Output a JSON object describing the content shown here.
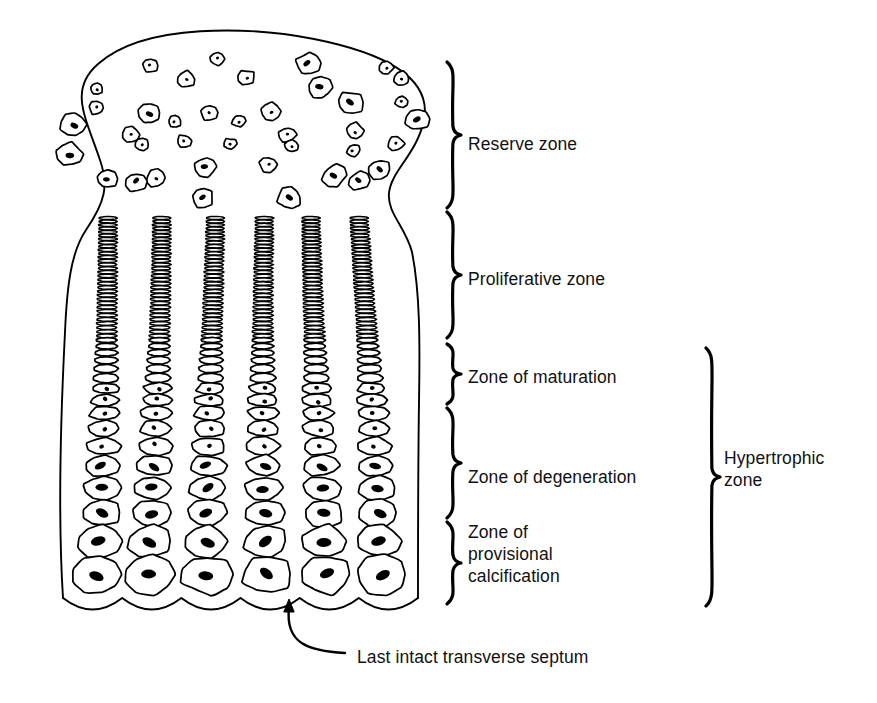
{
  "figure": {
    "background_color": "#ffffff",
    "ink_color": "#000000",
    "width": 877,
    "height": 703
  },
  "zone_labels": [
    {
      "id": "reserve",
      "text": "Reserve zone",
      "x": 468,
      "y": 133,
      "brace_top": 62,
      "brace_bottom": 208
    },
    {
      "id": "proliferative",
      "text": "Proliferative zone",
      "x": 468,
      "y": 268,
      "brace_top": 212,
      "brace_bottom": 338
    },
    {
      "id": "maturation",
      "text": "Zone of maturation",
      "x": 468,
      "y": 366,
      "brace_top": 344,
      "brace_bottom": 404
    },
    {
      "id": "degeneration",
      "text": "Zone of degeneration",
      "x": 468,
      "y": 466,
      "brace_top": 408,
      "brace_bottom": 518
    },
    {
      "id": "calcification",
      "text": "Zone of\nprovisional\ncalcification",
      "x": 468,
      "y": 521,
      "brace_top": 522,
      "brace_bottom": 604
    }
  ],
  "group_labels": [
    {
      "id": "hypertrophic",
      "text": "Hypertrophic\nzone",
      "x": 724,
      "y": 447,
      "brace_top": 348,
      "brace_bottom": 606
    }
  ],
  "callouts": [
    {
      "id": "septum",
      "text": "Last intact transverse septum",
      "x": 357,
      "y": 646,
      "arrow_tip_x": 289,
      "arrow_tip_y": 600,
      "arrow_tail_x": 345,
      "arrow_tail_y": 653
    }
  ],
  "braces": {
    "zone_brace_x": 447,
    "zone_brace_width": 14,
    "group_brace_x": 706,
    "group_brace_width": 14,
    "stroke_width": 3.2
  },
  "cartilage_outline": {
    "head_top_y": 35,
    "head_left_x": 45,
    "head_right_x": 432,
    "neck_y": 215,
    "shaft_left_x": 63,
    "shaft_right_x": 418,
    "bottom_y": 600
  },
  "chart_data": {
    "type": "diagram",
    "zones": [
      {
        "name": "Reserve zone",
        "y_range": [
          35,
          210
        ],
        "cell_pattern": "scattered round chondrocytes",
        "cell_count": 38
      },
      {
        "name": "Proliferative zone",
        "y_range": [
          210,
          340
        ],
        "cell_pattern": "dense flattened stacked cells in columns",
        "columns": 6
      },
      {
        "name": "Zone of maturation",
        "y_range": [
          340,
          405
        ],
        "cell_pattern": "enlarging flattened ellipses",
        "columns": 6
      },
      {
        "name": "Zone of degeneration",
        "y_range": [
          405,
          520
        ],
        "cell_pattern": "large oval cells with elongated nuclei",
        "columns": 6
      },
      {
        "name": "Zone of provisional calcification",
        "y_range": [
          520,
          600
        ],
        "cell_pattern": "largest polygonal lacunae, scalloped base",
        "columns": 6
      }
    ],
    "groups": [
      {
        "name": "Hypertrophic zone",
        "covers": [
          "Zone of maturation",
          "Zone of degeneration",
          "Zone of provisional calcification"
        ]
      }
    ],
    "annotations": [
      {
        "text": "Last intact transverse septum",
        "points_to": "scalloped base of calcification zone"
      }
    ],
    "columns_x": [
      108,
      158,
      212,
      265,
      315,
      362
    ]
  }
}
